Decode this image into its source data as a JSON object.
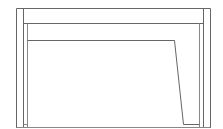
{
  "diagram": {
    "type": "line-drawing",
    "stroke_color": "#555555",
    "light_stroke_color": "#9a9a9a",
    "background": "#ffffff",
    "outer_frame": {
      "x1": 16.5,
      "x2": 210.5,
      "top": 8.5,
      "bottom": 128
    },
    "inner_frame": {
      "x1": 23.5,
      "x2": 203.5,
      "top": 23.5,
      "bottom": 128
    },
    "inner_posts": {
      "x1": 27.5,
      "x2": 199.5,
      "top": 24,
      "bottom": 128
    },
    "panel": {
      "points": "27.5,40.5 174.5,40.5 183.5,124.5 199.5,124.5"
    },
    "bottom_edge": {
      "y": 127.5
    }
  }
}
